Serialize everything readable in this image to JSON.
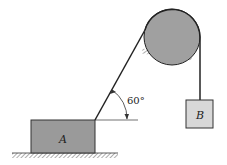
{
  "diagram": {
    "block_a": {
      "label": "A"
    },
    "block_b": {
      "label": "B"
    },
    "angle": {
      "label": "60°",
      "value_degrees": 60
    },
    "colors": {
      "block_fill": "#9a9a9a",
      "pulley_fill": "#a0a0a0",
      "block_b_fill": "#d8d8d8",
      "line": "#222222"
    }
  }
}
